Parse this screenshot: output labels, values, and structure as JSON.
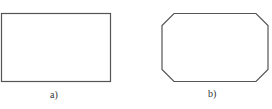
{
  "figures": [
    {
      "id": "a",
      "label": "a)",
      "shape": "rectangle"
    },
    {
      "id": "b",
      "label": "b)",
      "shape": "chamfered-rectangle"
    }
  ],
  "colors": {
    "stroke": "#555555",
    "background": "#ffffff"
  }
}
